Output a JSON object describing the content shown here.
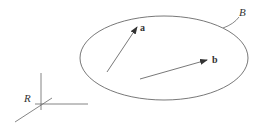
{
  "diagram": {
    "type": "vector-diagram",
    "colors": {
      "line": "#555555",
      "text": "#333333",
      "background": "#ffffff"
    },
    "frame": {
      "label": "R",
      "origin": [
        41,
        104
      ],
      "axes": [
        {
          "name": "vertical-axis",
          "from": [
            41,
            73
          ],
          "to": [
            41,
            110
          ]
        },
        {
          "name": "horizontal-axis",
          "from": [
            35,
            104
          ],
          "to": [
            88,
            104
          ]
        },
        {
          "name": "diagonal-axis",
          "from": [
            15,
            122
          ],
          "to": [
            52,
            98
          ]
        }
      ],
      "label_pos": [
        24,
        101
      ]
    },
    "body": {
      "label": "B",
      "ellipse": {
        "cx": 164,
        "cy": 58,
        "rx": 84,
        "ry": 42
      },
      "label_pos": [
        239,
        14
      ],
      "leader": {
        "from": [
          223,
          28
        ],
        "to": [
          239,
          17
        ]
      }
    },
    "vectors": [
      {
        "label": "a",
        "from": [
          107,
          72
        ],
        "to": [
          137,
          27
        ],
        "label_pos": [
          140,
          31
        ]
      },
      {
        "label": "b",
        "from": [
          140,
          79
        ],
        "to": [
          207,
          60
        ],
        "label_pos": [
          212,
          62
        ]
      }
    ]
  }
}
